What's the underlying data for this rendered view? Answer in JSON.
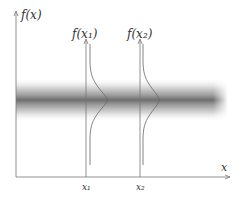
{
  "diagram": {
    "y_axis_label": "f(x)",
    "x_axis_label": "x",
    "distributions": [
      {
        "label": "f(x₁)",
        "tick_label": "x₁"
      },
      {
        "label": "f(x₂)",
        "tick_label": "x₂"
      }
    ],
    "band_description": "horizontal gray band with Gaussian density shading",
    "colors": {
      "axis": "#777777",
      "curve": "#666666",
      "band_dark": "#6e6e6e",
      "text": "#333333"
    }
  }
}
